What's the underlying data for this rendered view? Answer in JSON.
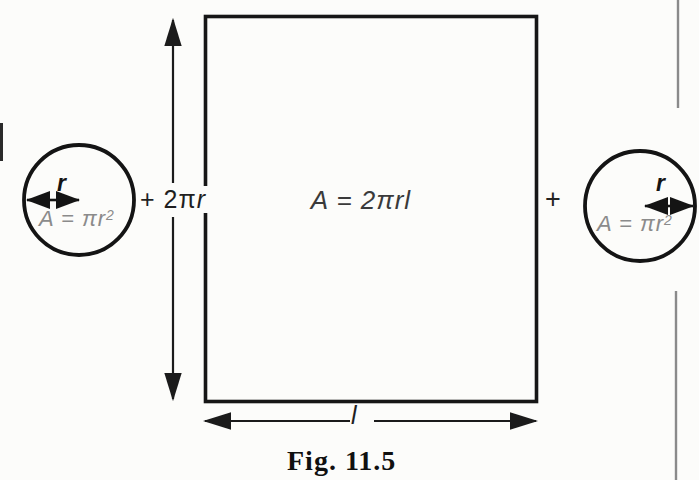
{
  "figure": {
    "caption": "Fig. 11.5",
    "left_circle": {
      "radius_label": "r",
      "formula_main": "A = πr",
      "formula_sup": "2"
    },
    "right_circle": {
      "radius_label": "r",
      "formula_main": "A = πr",
      "formula_sup": "2"
    },
    "height_label": {
      "prefix": "+ 2π",
      "radius": "r"
    },
    "rect_formula": "A = 2πrl",
    "plus_sign": "+",
    "length_label": "l",
    "colors": {
      "ink": "#1b1b1b",
      "gray_formula_text": "#8b8b8b",
      "page_edge_line": "#8a8a8a",
      "paper": "#fcfcfa"
    }
  }
}
